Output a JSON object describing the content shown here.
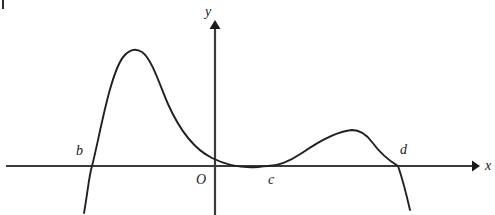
{
  "figure": {
    "width": 495,
    "height": 215,
    "background": "#ffffff",
    "stroke_color": "#231f20",
    "axis_color": "#3b3b3b"
  },
  "axes": {
    "x_axis": {
      "label": "x",
      "label_x": 485,
      "label_y": 159,
      "y": 166,
      "start_x": 6,
      "end_x": 478,
      "arrow": "right-arrowhead"
    },
    "y_axis": {
      "label": "y",
      "label_x": 205,
      "label_y": 5,
      "x": 215,
      "start_y": 215,
      "end_y": 22,
      "arrow": "up-arrowhead"
    },
    "origin": {
      "label": "O",
      "label_x": 196,
      "label_y": 173
    }
  },
  "labels": [
    {
      "name": "b",
      "text": "b",
      "x": 76,
      "y": 144
    },
    {
      "name": "c",
      "text": "c",
      "x": 268,
      "y": 173
    },
    {
      "name": "d",
      "text": "d",
      "x": 400,
      "y": 143
    }
  ],
  "chart_data": {
    "type": "line",
    "title": "",
    "xlabel": "x",
    "ylabel": "y",
    "roots": [
      "b",
      "c",
      "d"
    ],
    "root_multiplicity": {
      "b": 1,
      "c": 2,
      "d": 1
    },
    "grid": false,
    "legend": false,
    "features": [
      {
        "kind": "x-intercept",
        "label": "b",
        "x_px": 92,
        "y_px": 166
      },
      {
        "kind": "local-maximum",
        "label": "",
        "x_px": 138,
        "y_px": 50
      },
      {
        "kind": "y-intercept",
        "label": "",
        "x_px": 215,
        "y_px": 128
      },
      {
        "kind": "x-intercept-tangent",
        "label": "c",
        "x_px": 268,
        "y_px": 166
      },
      {
        "kind": "local-maximum",
        "label": "",
        "x_px": 357,
        "y_px": 131
      },
      {
        "kind": "x-intercept",
        "label": "d",
        "x_px": 398,
        "y_px": 166
      }
    ],
    "curve_path": "M 84,213 C 88,190 89,176 92,166 C 99,140 110,72 124,56 C 130,49 136,48 142,52 C 152,59 160,86 168,104 C 180,131 196,150 212,158 C 230,167 246,168 258,167 C 264,166 266,166 268,166 C 278,166 290,161 302,153 C 318,142 338,131 352,130 C 360,130 366,134 372,142 C 380,153 388,160 398,166 C 403,180 407,197 410,210"
  }
}
